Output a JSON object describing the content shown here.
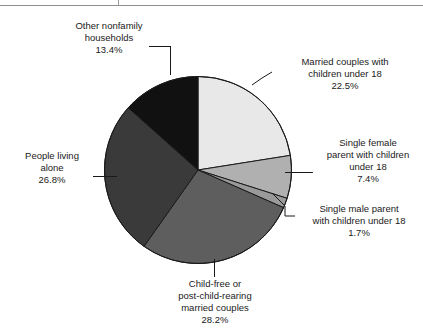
{
  "page": {
    "background_color": "#ffffff",
    "text_color": "#1a1a1a"
  },
  "chart_data": {
    "type": "pie",
    "title": "",
    "subtitle": "",
    "xlabel": "",
    "ylabel": "",
    "legend_position": "callout-labels",
    "grid": false,
    "units": "percent",
    "start_angle_deg": 0,
    "direction": "clockwise",
    "center": {
      "x": 198,
      "y": 170
    },
    "radius": 94,
    "categories": [
      "Married couples with children under 18",
      "Single female parent with children under 18",
      "Single male parent with children under 18",
      "Child-free or post-child-rearing married couples",
      "People living alone",
      "Other nonfamily households"
    ],
    "values": [
      22.5,
      7.4,
      1.7,
      28.2,
      26.8,
      13.4
    ],
    "colors": [
      "#e8e8e8",
      "#b0b0b0",
      "#9a9a9a",
      "#5e5e5e",
      "#3a3a3a",
      "#111111"
    ],
    "slices": [
      {
        "label_lines": [
          "Married couples with",
          "children under 18"
        ],
        "percent_text": "22.5%",
        "value": 22.5,
        "color": "#e8e8e8",
        "start_deg": 0.0,
        "end_deg": 81.0
      },
      {
        "label_lines": [
          "Single female",
          "parent with children",
          "under 18"
        ],
        "percent_text": "7.4%",
        "value": 7.4,
        "color": "#b0b0b0",
        "start_deg": 81.0,
        "end_deg": 107.64
      },
      {
        "label_lines": [
          "Single male parent",
          "with children under 18"
        ],
        "percent_text": "1.7%",
        "value": 1.7,
        "color": "#9a9a9a",
        "start_deg": 107.64,
        "end_deg": 113.76
      },
      {
        "label_lines": [
          "Child-free or",
          "post-child-rearing",
          "married couples"
        ],
        "percent_text": "28.2%",
        "value": 28.2,
        "color": "#5e5e5e",
        "start_deg": 113.76,
        "end_deg": 215.28
      },
      {
        "label_lines": [
          "People living",
          "alone"
        ],
        "percent_text": "26.8%",
        "value": 26.8,
        "color": "#3a3a3a",
        "start_deg": 215.28,
        "end_deg": 311.76
      },
      {
        "label_lines": [
          "Other nonfamily",
          "households"
        ],
        "percent_text": "13.4%",
        "value": 13.4,
        "color": "#111111",
        "start_deg": 311.76,
        "end_deg": 360.0
      }
    ]
  },
  "labels": {
    "other_nonfamily": {
      "line1": "Other nonfamily",
      "line2": "households",
      "percent": "13.4%"
    },
    "married_children": {
      "line1": "Married couples with",
      "line2": "children under 18",
      "percent": "22.5%"
    },
    "single_female": {
      "line1": "Single female",
      "line2": "parent with children",
      "line3": "under 18",
      "percent": "7.4%"
    },
    "single_male": {
      "line1": "Single male parent",
      "line2": "with children under 18",
      "percent": "1.7%"
    },
    "child_free": {
      "line1": "Child-free or",
      "line2": "post-child-rearing",
      "line3": "married couples",
      "percent": "28.2%"
    },
    "living_alone": {
      "line1": "People living",
      "line2": "alone",
      "percent": "26.8%"
    }
  }
}
